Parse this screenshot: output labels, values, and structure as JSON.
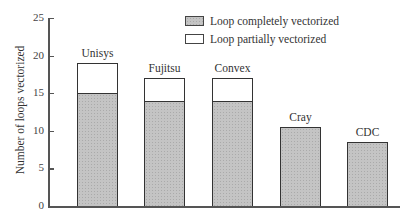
{
  "chart_data": {
    "type": "bar",
    "stacked": true,
    "title": "",
    "xlabel": "",
    "ylabel": "Number of loops vectorized",
    "ylim": [
      0,
      25
    ],
    "yticks": [
      0,
      5,
      10,
      15,
      20,
      25
    ],
    "grid": false,
    "legend_position": "top-right",
    "categories": [
      "Unisys",
      "Fujitsu",
      "Convex",
      "Cray",
      "CDC"
    ],
    "series": [
      {
        "name": "Loop completely vectorized",
        "values": [
          15,
          14,
          14,
          10.5,
          8.5
        ],
        "color": "#c4c4c4"
      },
      {
        "name": "Loop partially vectorized",
        "values": [
          4,
          3,
          3,
          0,
          0
        ],
        "color": "#ffffff"
      }
    ],
    "totals": [
      19,
      17,
      17,
      10.5,
      8.5
    ]
  },
  "labels": {
    "ylabel": "Number of loops vectorized",
    "yticks": [
      "0",
      "5",
      "10",
      "15",
      "20",
      "25"
    ],
    "legend": [
      "Loop completely vectorized",
      "Loop partially vectorized"
    ],
    "bars": [
      "Unisys",
      "Fujitsu",
      "Convex",
      "Cray",
      "CDC"
    ]
  }
}
